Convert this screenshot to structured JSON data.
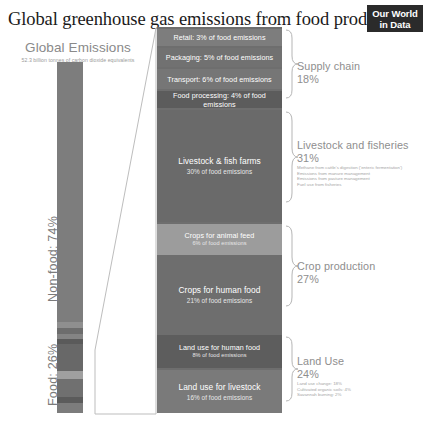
{
  "header": {
    "title": "Global greenhouse gas emissions from food production",
    "logo_line1": "Our World",
    "logo_line2": "in Data"
  },
  "left_panel": {
    "title": "Global Emissions",
    "subtitle": "52.3 billion tonnes of carbon dioxide equivalents",
    "nonfood_label": "Non-food: 74%",
    "food_label": "Food: 26%"
  },
  "chart_data": {
    "type": "bar",
    "title": "Global greenhouse gas emissions from food production",
    "subtitle": "52.3 billion tonnes of carbon dioxide equivalents",
    "unit": "% of food emissions",
    "total_emissions": "52.3 billion tonnes of carbon dioxide equivalents",
    "top_split": [
      {
        "name": "Non-food",
        "value": 74,
        "label": "Non-food: 74%"
      },
      {
        "name": "Food",
        "value": 26,
        "label": "Food: 26%"
      }
    ],
    "categories": [
      "Retail",
      "Packaging",
      "Transport",
      "Food processing",
      "Livestock & fish farms",
      "Crops for animal feed",
      "Crops for human food",
      "Land use for human food",
      "Land use for livestock"
    ],
    "values": [
      3,
      5,
      6,
      4,
      30,
      6,
      21,
      8,
      16
    ],
    "ylabel": "% of food emissions",
    "grid": false,
    "legend": false,
    "segments": [
      {
        "title": "Retail",
        "sub": "3% of food emissions",
        "value": 3,
        "group": "Supply chain",
        "shade": "#7a7a7a"
      },
      {
        "title": "Packaging",
        "sub": "5% of food emissions",
        "value": 5,
        "group": "Supply chain",
        "shade": "#6f6f6f"
      },
      {
        "title": "Transport",
        "sub": "6% of food emissions",
        "value": 6,
        "group": "Supply chain",
        "shade": "#757575"
      },
      {
        "title": "Food processing",
        "sub": "4% of food emissions",
        "value": 4,
        "group": "Supply chain",
        "shade": "#5e5e5e"
      },
      {
        "title": "Livestock & fish farms",
        "sub": "30% of food emissions",
        "value": 30,
        "group": "Livestock and fisheries",
        "shade": "#6b6b6b"
      },
      {
        "title": "Crops for animal feed",
        "sub": "6% of food emissions",
        "value": 6,
        "group": "Crop production",
        "shade": "#9a9a9a"
      },
      {
        "title": "Crops for human food",
        "sub": "21% of food emissions",
        "value": 21,
        "group": "Crop production",
        "shade": "#6e6e6e"
      },
      {
        "title": "Land use for human food",
        "sub": "8% of food emissions",
        "value": 8,
        "group": "Land Use",
        "shade": "#5f5f5f"
      },
      {
        "title": "Land use for livestock",
        "sub": "16% of food emissions",
        "value": 16,
        "group": "Land Use",
        "shade": "#797979"
      }
    ],
    "groups": [
      {
        "name": "Supply chain",
        "pct": "18%",
        "value": 18,
        "details": []
      },
      {
        "name": "Livestock and fisheries",
        "pct": "31%",
        "value": 31,
        "details": [
          "Methane from cattle's digestion ('enteric fermentation')",
          "Emissions from manure management",
          "Emissions from pasture management",
          "Fuel use from fisheries"
        ]
      },
      {
        "name": "Crop production",
        "pct": "27%",
        "value": 27,
        "details": []
      },
      {
        "name": "Land Use",
        "pct": "24%",
        "value": 24,
        "details": [
          "Land use change: 18%",
          "Cultivated organic soils: 4%",
          "Savannah burning: 2%"
        ]
      }
    ]
  },
  "segments_render": [
    {
      "title": "Retail",
      "sub": "3% of food emissions",
      "top": 2,
      "height": 17,
      "bg": "#7d7d7d",
      "size": "small"
    },
    {
      "title": "Packaging",
      "sub": "5% of food emissions",
      "top": 21,
      "height": 19,
      "bg": "#717171",
      "size": "small"
    },
    {
      "title": "Transport",
      "sub": "6% of food emissions",
      "top": 42,
      "height": 20,
      "bg": "#767676",
      "size": "small"
    },
    {
      "title": "Food processing",
      "sub": "4% of food emissions",
      "top": 64,
      "height": 17,
      "bg": "#5c5c5c",
      "size": "small"
    },
    {
      "title": "Livestock & fish farms",
      "sub": "30% of food emissions",
      "top": 83,
      "height": 112,
      "bg": "#6a6a6a",
      "size": "big"
    },
    {
      "title": "Crops for animal feed",
      "sub": "6% of food emissions",
      "top": 197,
      "height": 31,
      "bg": "#9c9c9c",
      "size": "small"
    },
    {
      "title": "Crops for human food",
      "sub": "21% of food emissions",
      "top": 230,
      "height": 76,
      "bg": "#6e6e6e",
      "size": "big"
    },
    {
      "title": "Land use for human food",
      "sub": "8% of food emissions",
      "top": 308,
      "height": 33,
      "bg": "#5d5d5d",
      "size": "small"
    },
    {
      "title": "Land use for livestock",
      "sub": "16% of food emissions",
      "top": 343,
      "height": 43,
      "bg": "#7a7a7a",
      "size": "big"
    }
  ],
  "annotations": [
    {
      "title": "Supply chain",
      "pct": "18%",
      "top": 60,
      "details": []
    },
    {
      "title": "Livestock and fisheries",
      "pct": "31%",
      "top": 139,
      "details": [
        "Methane from cattle's digestion ('enteric fermentation')",
        "Emissions from manure management",
        "Emissions from pasture management",
        "Fuel use from fisheries"
      ]
    },
    {
      "title": "Crop production",
      "pct": "27%",
      "top": 260,
      "details": []
    },
    {
      "title": "Land Use",
      "pct": "24%",
      "top": 355,
      "details": [
        "Land use change: 18%",
        "Cultivated organic soils: 4%",
        "Savannah burning: 2%"
      ]
    }
  ],
  "total_bar_segments": [
    {
      "name": "non-food",
      "top": 0,
      "height": 260,
      "bg": "#7d7d7d"
    },
    {
      "name": "food-retail",
      "top": 260,
      "height": 6,
      "bg": "#8f8f8f"
    },
    {
      "name": "food-packaging",
      "top": 266,
      "height": 6,
      "bg": "#6d6d6d"
    },
    {
      "name": "food-transport",
      "top": 272,
      "height": 5,
      "bg": "#848484"
    },
    {
      "name": "food-processing",
      "top": 277,
      "height": 5,
      "bg": "#5a5a5a"
    },
    {
      "name": "food-livestock",
      "top": 282,
      "height": 27,
      "bg": "#686868"
    },
    {
      "name": "food-crops-feed",
      "top": 309,
      "height": 8,
      "bg": "#a0a0a0"
    },
    {
      "name": "food-crops-human",
      "top": 317,
      "height": 18,
      "bg": "#707070"
    },
    {
      "name": "food-landuse-human",
      "top": 335,
      "height": 6,
      "bg": "#5b5b5b"
    },
    {
      "name": "food-landuse-livestock",
      "top": 341,
      "height": 10,
      "bg": "#7c7c7c"
    }
  ]
}
